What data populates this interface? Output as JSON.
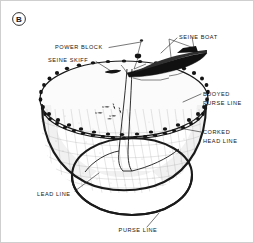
{
  "figure": {
    "panel_letter": "B",
    "panel_letter_icon": "circled-letter-b",
    "caption_absent": true
  },
  "labels": [
    {
      "id": "power-block",
      "text": "POWER BLOCK",
      "line1": "POWER BLOCK",
      "line2": "",
      "x": 54,
      "y": 48,
      "anchor": "start"
    },
    {
      "id": "seine-skiff",
      "text": "SEINE SKIFF",
      "line1": "SEINE SKIFF",
      "line2": "",
      "x": 47,
      "y": 61,
      "anchor": "start"
    },
    {
      "id": "seine-boat",
      "text": "SEINE BOAT",
      "line1": "SEINE BOAT",
      "line2": "",
      "x": 178,
      "y": 38,
      "anchor": "start"
    },
    {
      "id": "buoyed-purse-line",
      "text": "BUOYED PURSE LINE",
      "line1": "BUOYED",
      "line2": "PURSE LINE",
      "x": 202,
      "y": 95,
      "anchor": "start"
    },
    {
      "id": "corked-head-line",
      "text": "CORKED HEAD LINE",
      "line1": "CORKED",
      "line2": "HEAD LINE",
      "x": 202,
      "y": 133,
      "anchor": "start"
    },
    {
      "id": "lead-line",
      "text": "LEAD LINE",
      "line1": "LEAD LINE",
      "line2": "",
      "x": 36,
      "y": 195,
      "anchor": "start"
    },
    {
      "id": "purse-line",
      "text": "PURSE LINE",
      "line1": "PURSE LINE",
      "line2": "",
      "x": 137,
      "y": 231,
      "anchor": "middle"
    }
  ],
  "colors": {
    "ink": "#1a1a1a",
    "background": "#ffffff",
    "border": "#cfcfcf",
    "mesh": "#a6a6a6",
    "shade": "#f1f1f1"
  },
  "diagram": {
    "title_absent": true,
    "parts": [
      "seine boat",
      "seine skiff",
      "power block",
      "buoyed purse line",
      "corked head line",
      "lead line",
      "purse line",
      "net webbing",
      "fish school"
    ]
  }
}
